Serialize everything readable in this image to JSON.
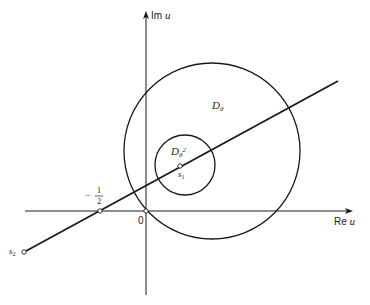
{
  "diagram": {
    "axes": {
      "imaginary_label": "Im",
      "imaginary_var": "u",
      "real_label": "Re",
      "real_var": "u",
      "origin_label": "0"
    },
    "regions": {
      "outer_disk_label": "D",
      "outer_disk_sub": "θ",
      "inner_disk_label": "D",
      "inner_disk_sub": "θ",
      "inner_disk_sup": "2"
    },
    "points": {
      "s1_label": "s",
      "s1_sub": "1",
      "s2_label": "s",
      "s2_sub": "2",
      "half_sign": "−",
      "half_num": "1",
      "half_den": "2"
    },
    "colors": {
      "stroke": "#1a1a1a",
      "background": "#ffffff"
    }
  }
}
